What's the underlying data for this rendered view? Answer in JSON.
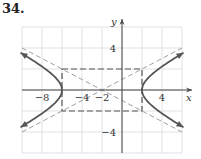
{
  "problem": {
    "number": "34."
  },
  "chart_data": {
    "type": "line",
    "title": "",
    "xlabel": "x",
    "ylabel": "y",
    "xlim": [
      -10,
      6
    ],
    "ylim": [
      -6,
      6
    ],
    "grid": true,
    "grid_step": 2,
    "x_tick_labels": [
      {
        "value": -8,
        "label": "−8"
      },
      {
        "value": -4,
        "label": "−4"
      },
      {
        "value": -2,
        "label": "−2"
      },
      {
        "value": 4,
        "label": "4"
      }
    ],
    "y_tick_labels": [
      {
        "value": 4,
        "label": "4"
      },
      {
        "value": -4,
        "label": "−4"
      }
    ],
    "curve": {
      "kind": "hyperbola",
      "equation": "(x+2)^2/16 - y^2/4 = 1",
      "center": [
        -2,
        0
      ],
      "a": 4,
      "b": 2,
      "vertices": [
        [
          -6,
          0
        ],
        [
          2,
          0
        ]
      ],
      "branches": [
        "left",
        "right"
      ],
      "arrows": true
    },
    "asymptotes": [
      {
        "equation": "y = (x+2)/2",
        "style": "dashed"
      },
      {
        "equation": "y = -(x+2)/2",
        "style": "dashed"
      }
    ],
    "fundamental_rectangle": {
      "x": [
        -6,
        2
      ],
      "y": [
        -2,
        2
      ],
      "style": "dashed"
    }
  },
  "colors": {
    "grid": "#d9d9d9",
    "axis": "#444444",
    "curve": "#555555",
    "asymptote": "#a0a0a0",
    "rectangle": "#555555"
  }
}
